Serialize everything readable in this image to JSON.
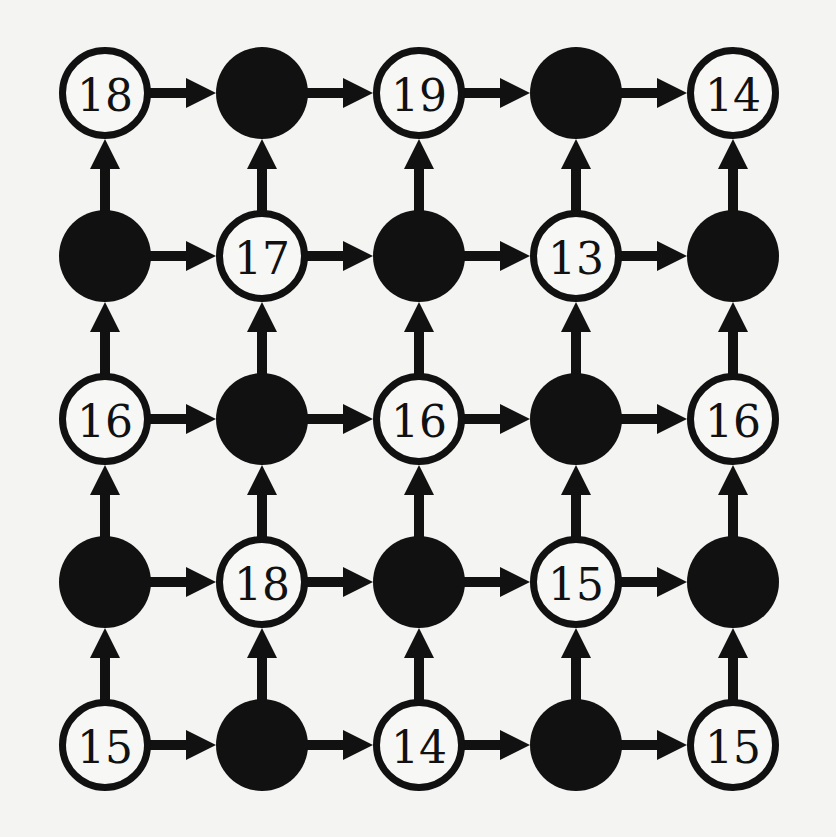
{
  "diagram": {
    "type": "directed-grid-graph",
    "rows": 5,
    "cols": 5,
    "colors": {
      "background": "#f4f4f2",
      "ink": "#111111",
      "open_fill": "#f7f7f5"
    },
    "layout": {
      "col_x": [
        105,
        262,
        419,
        576,
        733
      ],
      "row_y": [
        93,
        256,
        419,
        582,
        745
      ],
      "node_radius": 45,
      "stroke_width": 7,
      "arrow_shaft_width": 10
    },
    "edge_rule": "each node points right to its neighbor and up to its neighbor",
    "nodes": [
      [
        {
          "filled": false,
          "label": "18"
        },
        {
          "filled": true,
          "label": ""
        },
        {
          "filled": false,
          "label": "19"
        },
        {
          "filled": true,
          "label": ""
        },
        {
          "filled": false,
          "label": "14"
        }
      ],
      [
        {
          "filled": true,
          "label": ""
        },
        {
          "filled": false,
          "label": "17"
        },
        {
          "filled": true,
          "label": ""
        },
        {
          "filled": false,
          "label": "13"
        },
        {
          "filled": true,
          "label": ""
        }
      ],
      [
        {
          "filled": false,
          "label": "16"
        },
        {
          "filled": true,
          "label": ""
        },
        {
          "filled": false,
          "label": "16"
        },
        {
          "filled": true,
          "label": ""
        },
        {
          "filled": false,
          "label": "16"
        }
      ],
      [
        {
          "filled": true,
          "label": ""
        },
        {
          "filled": false,
          "label": "18"
        },
        {
          "filled": true,
          "label": ""
        },
        {
          "filled": false,
          "label": "15"
        },
        {
          "filled": true,
          "label": ""
        }
      ],
      [
        {
          "filled": false,
          "label": "15"
        },
        {
          "filled": true,
          "label": ""
        },
        {
          "filled": false,
          "label": "14"
        },
        {
          "filled": true,
          "label": ""
        },
        {
          "filled": false,
          "label": "15"
        }
      ]
    ]
  }
}
